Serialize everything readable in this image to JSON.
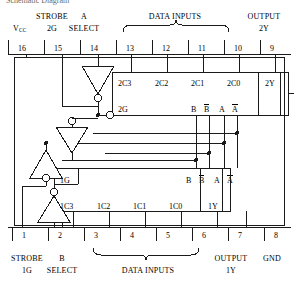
{
  "title": "Schematic Diagram",
  "top": {
    "groups": [
      {
        "name": "strobe-2g",
        "line1": "STROBE",
        "line2": "2G"
      },
      {
        "name": "a-select",
        "line1": "A",
        "line2": "SELECT"
      },
      {
        "name": "data-inputs",
        "line1": "DATA INPUTS",
        "line2": ""
      },
      {
        "name": "output-2y",
        "line1": "OUTPUT",
        "line2": "2Y"
      }
    ],
    "vcc": "V",
    "vcc_sub": "CC",
    "pins": [
      "16",
      "15",
      "14",
      "13",
      "12",
      "11",
      "10",
      "9"
    ]
  },
  "bottom": {
    "pins": [
      "1",
      "2",
      "3",
      "4",
      "5",
      "6",
      "7",
      "8"
    ],
    "groups": [
      {
        "name": "strobe-1g",
        "line1": "STROBE",
        "line2": "1G"
      },
      {
        "name": "b-select",
        "line1": "B",
        "line2": "SELECT"
      },
      {
        "name": "data-inputs",
        "line1": "DATA INPUTS",
        "line2": ""
      },
      {
        "name": "output-1y",
        "line1": "OUTPUT",
        "line2": "1Y"
      },
      {
        "name": "gnd",
        "line1": "GND",
        "line2": ""
      }
    ]
  },
  "mux2": {
    "name": "mux-2",
    "top_labels": [
      "2C3",
      "2C2",
      "2C1",
      "2C0",
      "2Y"
    ],
    "enable": "2G",
    "select_labels": [
      "B",
      "B",
      "A",
      "A"
    ],
    "select_overbar": [
      false,
      true,
      false,
      true
    ]
  },
  "mux1": {
    "name": "mux-1",
    "enable": "1G",
    "select_labels": [
      "B",
      "B",
      "A",
      "A"
    ],
    "select_overbar": [
      false,
      true,
      false,
      true
    ],
    "bottom_labels": [
      "1C3",
      "1C2",
      "1C1",
      "1C0",
      "1Y"
    ]
  },
  "gates": [
    {
      "name": "inverter-2g",
      "direction": "down",
      "bubble": "output"
    },
    {
      "name": "inverter-b",
      "direction": "down",
      "bubble": "input"
    },
    {
      "name": "inverter-a",
      "direction": "up",
      "bubble": "output"
    },
    {
      "name": "inverter-1g",
      "direction": "up",
      "bubble": "output"
    }
  ],
  "colors": {
    "line": "#1a1a1a",
    "background": "#ffffff",
    "text": "#000000"
  }
}
